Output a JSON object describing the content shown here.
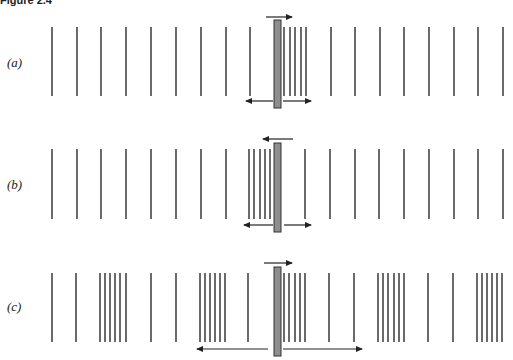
{
  "title": "Figure 2.4",
  "colors": {
    "line": "#2b2b2b",
    "rod_fill": "#8e8e8e",
    "rod_stroke": "#333333",
    "arrow": "#222222"
  },
  "rows": [
    {
      "label": "(a)",
      "label_y": 55,
      "line_top": 27,
      "line_bottom": 96,
      "lines_x": [
        52,
        77,
        101,
        126,
        151,
        176,
        201,
        226,
        250,
        284,
        290,
        295,
        301,
        306,
        331,
        355,
        380,
        404,
        429,
        454,
        478,
        503
      ],
      "rod": {
        "x": 274,
        "w": 7,
        "top": 20,
        "bottom": 108
      },
      "top_arrow": {
        "y": 17,
        "x1": 266,
        "x2": 292
      },
      "bottom_arrows": [
        {
          "y": 101,
          "x1": 273,
          "x2": 246
        },
        {
          "y": 101,
          "x1": 283,
          "x2": 311
        }
      ]
    },
    {
      "label": "(b)",
      "label_y": 177,
      "line_top": 149,
      "line_bottom": 219,
      "lines_x": [
        52,
        77,
        101,
        126,
        151,
        176,
        201,
        226,
        249,
        254,
        260,
        265,
        270,
        305,
        330,
        355,
        379,
        404,
        429,
        454,
        478,
        503
      ],
      "rod": {
        "x": 274,
        "w": 7,
        "top": 143,
        "bottom": 232
      },
      "top_arrow": {
        "y": 139,
        "x1": 293,
        "x2": 263
      },
      "bottom_arrows": [
        {
          "y": 225,
          "x1": 273,
          "x2": 244
        },
        {
          "y": 225,
          "x1": 284,
          "x2": 311
        }
      ]
    },
    {
      "label": "(c)",
      "label_y": 299,
      "line_top": 273,
      "line_bottom": 342,
      "lines_x": [
        52,
        76,
        100,
        105,
        110,
        115,
        120,
        126,
        151,
        176,
        200,
        205,
        210,
        215,
        220,
        225,
        248,
        284,
        289,
        295,
        300,
        305,
        329,
        354,
        378,
        383,
        388,
        394,
        399,
        404,
        428,
        453,
        477,
        482,
        487,
        492,
        497,
        502
      ],
      "rod": {
        "x": 274,
        "w": 7,
        "top": 267,
        "bottom": 356
      },
      "top_arrow": {
        "y": 263,
        "x1": 264,
        "x2": 292
      },
      "bottom_arrows": [
        {
          "y": 349,
          "x1": 268,
          "x2": 197
        },
        {
          "y": 349,
          "x1": 283,
          "x2": 362
        }
      ]
    }
  ]
}
